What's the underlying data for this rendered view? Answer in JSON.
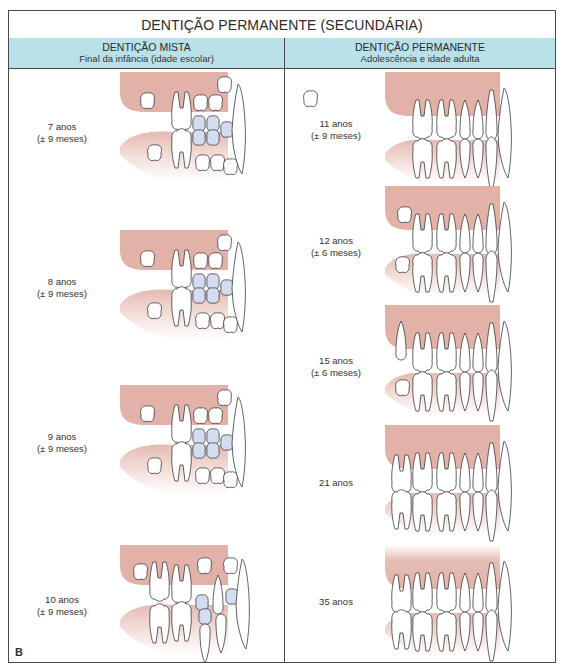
{
  "title": "DENTIÇÃO PERMANENTE (SECUNDÁRIA)",
  "columns": [
    {
      "heading": "DENTIÇÃO MISTA",
      "subheading": "Final da infância (idade escolar)",
      "stages": [
        {
          "age": "7 anos",
          "range": "(± 9 meses)"
        },
        {
          "age": "8 anos",
          "range": "(± 9 meses)"
        },
        {
          "age": "9 anos",
          "range": "(± 9 meses)"
        },
        {
          "age": "10 anos",
          "range": "(± 9 meses)"
        }
      ]
    },
    {
      "heading": "DENTIÇÃO PERMANENTE",
      "subheading": "Adolescência e idade adulta",
      "stages": [
        {
          "age": "11 anos",
          "range": "(± 9 meses)"
        },
        {
          "age": "12 anos",
          "range": "(± 6 meses)"
        },
        {
          "age": "15 anos",
          "range": "(± 6 meses)"
        },
        {
          "age": "21 anos",
          "range": ""
        },
        {
          "age": "35 anos",
          "range": ""
        }
      ]
    }
  ],
  "figure_letter": "B",
  "colors": {
    "header_bg": "#b8e1ea",
    "gum": "#e2b2a8",
    "primary_tooth": "#d3dcf0",
    "tooth_fill": "#ffffff",
    "outline": "#3a3a3a"
  }
}
